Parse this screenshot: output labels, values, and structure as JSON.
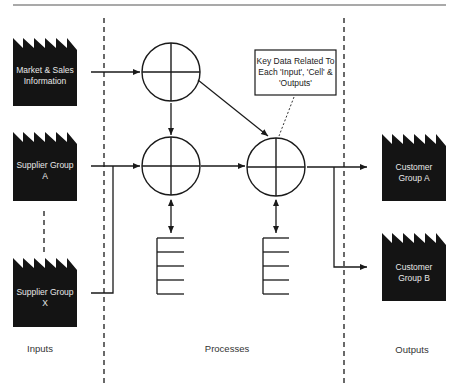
{
  "diagram": {
    "type": "process-flow",
    "zones": [
      {
        "id": "inputs",
        "label": "Inputs"
      },
      {
        "id": "processes",
        "label": "Processes"
      },
      {
        "id": "outputs",
        "label": "Outputs"
      }
    ],
    "inputs": [
      {
        "id": "market",
        "line1": "Market & Sales",
        "line2": "Information"
      },
      {
        "id": "supplier_a",
        "line1": "Supplier Group",
        "line2": "A"
      },
      {
        "id": "supplier_x",
        "line1": "Supplier Group",
        "line2": "X"
      }
    ],
    "outputs": [
      {
        "id": "customer_a",
        "line1": "Customer",
        "line2": "Group A"
      },
      {
        "id": "customer_b",
        "line1": "Customer",
        "line2": "Group B"
      }
    ],
    "callout": {
      "line1": "Key Data Related To",
      "line2": "Each 'Input', 'Cell' &",
      "line3": "'Outputs'"
    },
    "process_cells": 3,
    "data_stores": 2,
    "colors": {
      "block_fill": "#141414",
      "stroke": "#1a1a1a",
      "block_text": "#e8e8e8"
    }
  }
}
